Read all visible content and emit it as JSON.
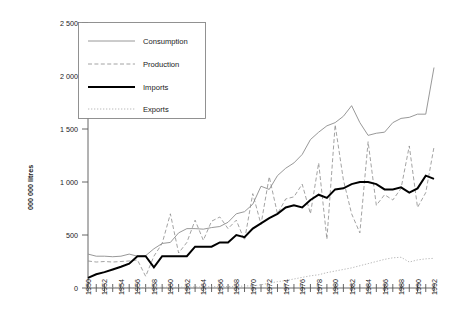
{
  "chart_data": {
    "type": "line",
    "title": "",
    "xlabel": "",
    "ylabel": "000 000 litres",
    "ylim": [
      0,
      2500
    ],
    "ytick_values": [
      0,
      500,
      1000,
      1500,
      2000,
      2500
    ],
    "ytick_labels": [
      "0",
      "500",
      "1 000",
      "1 500",
      "2 000",
      "2 500"
    ],
    "xlim": [
      1950,
      1992
    ],
    "x": [
      1950,
      1951,
      1952,
      1953,
      1954,
      1955,
      1956,
      1957,
      1958,
      1959,
      1960,
      1961,
      1962,
      1963,
      1964,
      1965,
      1966,
      1967,
      1968,
      1969,
      1970,
      1971,
      1972,
      1973,
      1974,
      1975,
      1976,
      1977,
      1978,
      1979,
      1980,
      1981,
      1982,
      1983,
      1984,
      1985,
      1986,
      1987,
      1988,
      1989,
      1990,
      1991,
      1992
    ],
    "xtick_labels": [
      "1950",
      "1952",
      "1954",
      "1956",
      "1958",
      "1960",
      "1962",
      "1964",
      "1966",
      "1968",
      "1970",
      "1972",
      "1974",
      "1976",
      "1978",
      "1980",
      "1982",
      "1984",
      "1986",
      "1988",
      "1990",
      "1992"
    ],
    "xtick_interval_years": 2,
    "minor_tick_interval_years": 1,
    "grid": false,
    "legend_position": "top-left",
    "series": [
      {
        "name": "Consumption",
        "style": "solid-thin-gray",
        "color": "#8c8c8c",
        "values": [
          320,
          300,
          300,
          295,
          300,
          320,
          300,
          305,
          370,
          420,
          430,
          520,
          560,
          560,
          555,
          570,
          580,
          620,
          700,
          720,
          790,
          960,
          930,
          1060,
          1130,
          1180,
          1260,
          1400,
          1470,
          1530,
          1560,
          1620,
          1720,
          1560,
          1440,
          1460,
          1470,
          1560,
          1600,
          1610,
          1640,
          1640,
          2080
        ]
      },
      {
        "name": "Production",
        "style": "dashed-gray",
        "color": "#8c8c8c",
        "values": [
          255,
          245,
          250,
          245,
          250,
          255,
          265,
          110,
          300,
          420,
          700,
          330,
          430,
          640,
          450,
          630,
          670,
          560,
          640,
          450,
          890,
          600,
          1050,
          700,
          840,
          860,
          980,
          700,
          1180,
          460,
          1540,
          1020,
          700,
          520,
          1380,
          780,
          880,
          830,
          940,
          1340,
          760,
          900,
          1330
        ]
      },
      {
        "name": "Imports",
        "style": "solid-thick-black",
        "color": "#000000",
        "values": [
          95,
          130,
          150,
          175,
          200,
          230,
          300,
          300,
          195,
          300,
          300,
          300,
          300,
          390,
          390,
          390,
          430,
          430,
          500,
          480,
          560,
          610,
          660,
          700,
          760,
          780,
          760,
          830,
          880,
          850,
          930,
          940,
          980,
          1000,
          1000,
          980,
          930,
          930,
          950,
          900,
          940,
          1060,
          1030
        ]
      },
      {
        "name": "Exports",
        "style": "dotted-lightgray",
        "color": "#a8a8a8",
        "values": [
          5,
          4,
          5,
          6,
          5,
          5,
          4,
          5,
          6,
          6,
          8,
          7,
          8,
          10,
          10,
          12,
          12,
          14,
          16,
          18,
          22,
          30,
          45,
          60,
          70,
          85,
          100,
          115,
          125,
          145,
          160,
          175,
          190,
          210,
          230,
          250,
          270,
          285,
          290,
          245,
          265,
          275,
          280
        ]
      }
    ]
  },
  "legend": {
    "items": [
      {
        "label": "Consumption"
      },
      {
        "label": "Production"
      },
      {
        "label": "Imports"
      },
      {
        "label": "Exports"
      }
    ]
  }
}
